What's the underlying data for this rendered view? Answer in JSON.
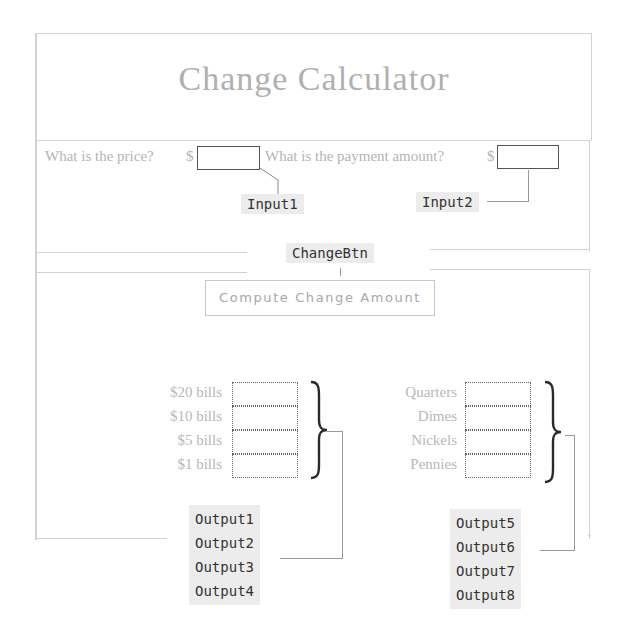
{
  "header": {
    "title": "Change Calculator"
  },
  "inputs": {
    "price_prompt": "What is the price?",
    "price_currency": "$",
    "price_value": "",
    "payment_prompt": "What is the payment amount?",
    "payment_currency": "$",
    "payment_value": ""
  },
  "annotations": {
    "input1": "Input1",
    "input2": "Input2",
    "change_btn": "ChangeBtn",
    "outputs_left": [
      "Output1",
      "Output2",
      "Output3",
      "Output4"
    ],
    "outputs_right": [
      "Output5",
      "Output6",
      "Output7",
      "Output8"
    ]
  },
  "button": {
    "label": "Compute Change Amount"
  },
  "outputs": {
    "bills": [
      {
        "label": "$20 bills",
        "value": ""
      },
      {
        "label": "$10 bills",
        "value": ""
      },
      {
        "label": "$5 bills",
        "value": ""
      },
      {
        "label": "$1 bills",
        "value": ""
      }
    ],
    "coins": [
      {
        "label": "Quarters",
        "value": ""
      },
      {
        "label": "Dimes",
        "value": ""
      },
      {
        "label": "Nickels",
        "value": ""
      },
      {
        "label": "Pennies",
        "value": ""
      }
    ]
  },
  "colors": {
    "border": "#d2d2d2",
    "label_text": "#b4b4b4",
    "annotation_bg": "#ececec",
    "input_border": "#555555"
  }
}
